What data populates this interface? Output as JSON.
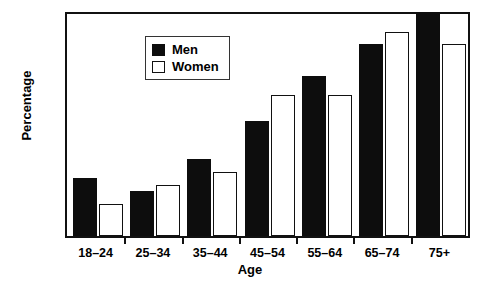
{
  "chart_data": {
    "type": "bar",
    "title": "",
    "xlabel": "Age",
    "ylabel": "Percentage",
    "categories": [
      "18–24",
      "25–34",
      "35–44",
      "45–54",
      "55–64",
      "65–74",
      "75+"
    ],
    "series": [
      {
        "name": "Men",
        "color": "#0d0d0d",
        "fill": "solid",
        "values": [
          9,
          7,
          12,
          18,
          25,
          30,
          35
        ]
      },
      {
        "name": "Women",
        "color": "#ffffff",
        "fill": "hollow",
        "values": [
          5,
          8,
          10,
          22,
          22,
          31.8,
          30
        ]
      }
    ],
    "ylim": [
      0,
      35
    ],
    "yticks": [
      0,
      5,
      10,
      15,
      20,
      25,
      30,
      35
    ],
    "ytick_labels": [
      "0",
      "5",
      "10",
      "15",
      "20",
      "25",
      "30",
      "35"
    ],
    "grid": false,
    "legend_position": "upper left",
    "frame": "box"
  },
  "legend": {
    "entries": [
      {
        "label": "Men",
        "swatch": "filled-square-icon"
      },
      {
        "label": "Women",
        "swatch": "hollow-square-icon"
      }
    ]
  }
}
